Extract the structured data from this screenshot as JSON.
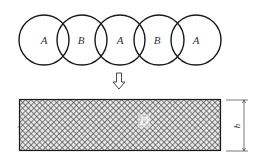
{
  "diagram": {
    "circles": [
      {
        "label": "A",
        "cx": 44,
        "cy": 40,
        "r": 25
      },
      {
        "label": "B",
        "cx": 82,
        "cy": 40,
        "r": 25
      },
      {
        "label": "A",
        "cx": 120,
        "cy": 40,
        "r": 25
      },
      {
        "label": "B",
        "cx": 159,
        "cy": 40,
        "r": 25
      },
      {
        "label": "A",
        "cx": 196,
        "cy": 40,
        "r": 25
      }
    ],
    "arrow": {
      "direction": "down",
      "glyph": "⇩"
    },
    "layer": {
      "label": "D"
    },
    "dimension": {
      "label": "h"
    },
    "colors": {
      "stroke": "#1a1a1a",
      "hatch": "#555555",
      "background": "#ffffff"
    }
  }
}
